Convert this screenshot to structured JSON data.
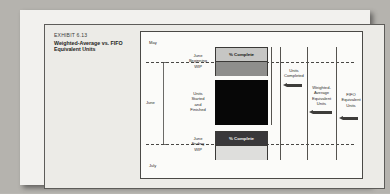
{
  "exhibit": {
    "number": "EXHIBIT 6.13",
    "title": "Weighted-Average vs. FIFO Equivalent Units"
  },
  "diagram": {
    "type": "process-cost-flow",
    "timeline": {
      "top_period": "May",
      "middle_period": "June",
      "bottom_period": "July"
    },
    "row_labels": {
      "beginning_wip": "June\nBeginning\nWIP",
      "units_started_finished": "Units\nStarted\nand\nFinished",
      "ending_wip": "June\nEnding\nWIP"
    },
    "bars": {
      "beginning_wip_label": "% Complete",
      "ending_wip_label": "% Complete"
    },
    "brackets": [
      {
        "name": "units-completed",
        "label": "Units\nCompleted"
      },
      {
        "name": "weighted-average",
        "label": "Weighted-\nAverage\nEquivalent\nUnits"
      },
      {
        "name": "fifo",
        "label": "FIFO\nEquivalent\nUnits"
      }
    ],
    "colors": {
      "beginning_wip_top": "#c6c6c4",
      "beginning_wip_bottom": "#8e8e8c",
      "units_started_finished": "#070707",
      "ending_wip_top": "#39383a",
      "ending_wip_bottom": "#dededc",
      "rule": "#55534f",
      "page": "#f2f1ee"
    }
  }
}
